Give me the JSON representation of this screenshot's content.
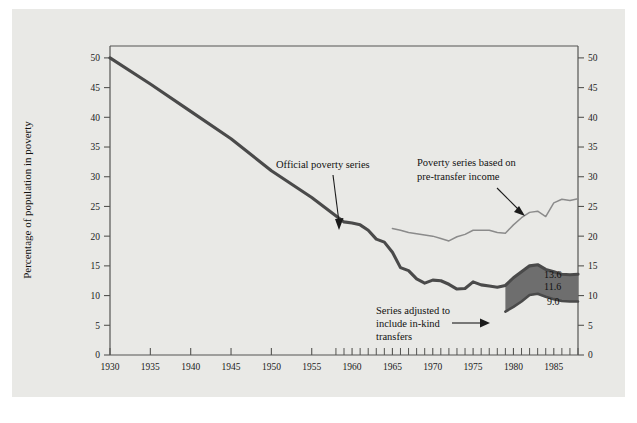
{
  "figure": {
    "background_color": "#e9e9e6",
    "page_color": "#ffffff"
  },
  "chart_data": {
    "type": "line",
    "title": "",
    "xlabel": "",
    "ylabel": "Percentage of population in poverty",
    "xlim": [
      1930,
      1988
    ],
    "ylim": [
      0,
      52
    ],
    "grid": false,
    "legend": "none",
    "x_ticks_major": [
      1930,
      1935,
      1940,
      1945,
      1950,
      1955,
      1960,
      1965,
      1970,
      1975,
      1980,
      1985
    ],
    "x_tick_labels": [
      "1930",
      "1935",
      "1940",
      "1945",
      "1950",
      "1955",
      "1960",
      "1965",
      "1970",
      "1975",
      "1980",
      "1985"
    ],
    "x_ticks_minor_start": 1958,
    "x_ticks_minor_end": 1988,
    "y_ticks": [
      0,
      5,
      10,
      15,
      20,
      25,
      30,
      35,
      40,
      45,
      50
    ],
    "y_tick_labels": [
      "0",
      "5",
      "10",
      "15",
      "20",
      "25",
      "30",
      "35",
      "40",
      "45",
      "50"
    ],
    "y_axis_left": true,
    "y_axis_right": true,
    "series": [
      {
        "name": "Official poverty series",
        "color": "#4a4a4a",
        "style": "thick-line",
        "x": [
          1930,
          1935,
          1940,
          1945,
          1950,
          1955,
          1959,
          1960,
          1961,
          1962,
          1963,
          1964,
          1965,
          1966,
          1967,
          1968,
          1969,
          1970,
          1971,
          1972,
          1973,
          1974,
          1975,
          1976,
          1977,
          1978,
          1979,
          1980,
          1981,
          1982,
          1983,
          1984,
          1985,
          1986,
          1987,
          1988
        ],
        "values": [
          50.0,
          45.6,
          41.0,
          36.4,
          31.0,
          26.5,
          22.4,
          22.2,
          21.9,
          21.0,
          19.5,
          19.0,
          17.3,
          14.7,
          14.2,
          12.8,
          12.1,
          12.6,
          12.5,
          11.9,
          11.1,
          11.2,
          12.3,
          11.8,
          11.6,
          11.4,
          11.7,
          13.0,
          14.0,
          15.0,
          15.2,
          14.4,
          14.0,
          13.6,
          13.5,
          13.6
        ]
      },
      {
        "name": "Poverty series based on pre-transfer income",
        "color": "#8b8b8b",
        "style": "thin-line",
        "x": [
          1965,
          1966,
          1967,
          1968,
          1969,
          1970,
          1971,
          1972,
          1973,
          1974,
          1975,
          1976,
          1977,
          1978,
          1979,
          1980,
          1981,
          1982,
          1983,
          1984,
          1985,
          1986,
          1987,
          1988
        ],
        "values": [
          21.3,
          21.0,
          20.6,
          20.4,
          20.2,
          20.0,
          19.6,
          19.2,
          19.9,
          20.3,
          21.0,
          21.0,
          21.0,
          20.6,
          20.5,
          21.9,
          23.1,
          24.0,
          24.2,
          23.3,
          25.6,
          26.2,
          26.0,
          26.3
        ]
      },
      {
        "name": "Series adjusted to include in-kind transfers",
        "color": "#4a4a4a",
        "style": "thick-line-with-band",
        "x": [
          1979,
          1980,
          1981,
          1982,
          1983,
          1984,
          1985,
          1986,
          1987,
          1988
        ],
        "values": [
          7.3,
          8.1,
          9.0,
          10.1,
          10.3,
          9.8,
          9.4,
          9.1,
          9.0,
          9.0
        ]
      }
    ],
    "band": {
      "name": "in-kind transfer adjustment band",
      "fill": "#6e6e6e",
      "upper_series": "Official poverty series",
      "lower_series": "Series adjusted to include in-kind transfers",
      "x_start": 1979,
      "x_end": 1988
    },
    "annotations": [
      {
        "id": "official-series-annotation",
        "text": "Official poverty series",
        "points_to_x": 1961,
        "points_to_y": 22.0
      },
      {
        "id": "pretransfer-series-annotation",
        "text_line1": "Poverty series based on",
        "text_line2": "pre-transfer income",
        "points_to_x": 1985,
        "points_to_y": 25.6
      },
      {
        "id": "inkind-series-annotation",
        "text_line1": "Series adjusted to",
        "text_line2": "include in-kind",
        "text_line3": "transfers",
        "points_to_x": 1979,
        "points_to_y": 9.0
      }
    ],
    "data_labels": [
      {
        "id": "label-official-end",
        "text": "13.6",
        "value": 13.6,
        "series": "Official poverty series"
      },
      {
        "id": "label-band-upper-end",
        "text": "11.6",
        "value": 11.6,
        "series": "band upper edge"
      },
      {
        "id": "label-inkind-end",
        "text": "9.0",
        "value": 9.0,
        "series": "Series adjusted to include in-kind transfers"
      }
    ]
  }
}
